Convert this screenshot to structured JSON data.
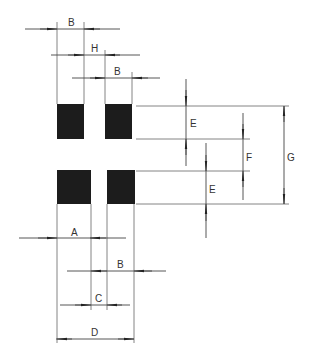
{
  "diagram": {
    "type": "land-pattern-dimension-drawing",
    "colors": {
      "pad": "#1c1c1c",
      "line": "#555555",
      "arrow": "#222222",
      "background": "#ffffff"
    },
    "pads": [
      {
        "id": "top-left",
        "x": 57,
        "y": 104,
        "w": 27,
        "h": 35
      },
      {
        "id": "top-right",
        "x": 105,
        "y": 104,
        "w": 27,
        "h": 35
      },
      {
        "id": "bottom-left",
        "x": 57,
        "y": 170,
        "w": 34,
        "h": 34
      },
      {
        "id": "bottom-right",
        "x": 107,
        "y": 170,
        "w": 28,
        "h": 34
      }
    ],
    "dimensions": {
      "B_top": {
        "label": "B"
      },
      "H": {
        "label": "H"
      },
      "B_mid": {
        "label": "B"
      },
      "E_top": {
        "label": "E"
      },
      "F": {
        "label": "F"
      },
      "G": {
        "label": "G"
      },
      "E_bottom": {
        "label": "E"
      },
      "A": {
        "label": "A"
      },
      "B_bottom": {
        "label": "B"
      },
      "C": {
        "label": "C"
      },
      "D": {
        "label": "D"
      }
    }
  }
}
